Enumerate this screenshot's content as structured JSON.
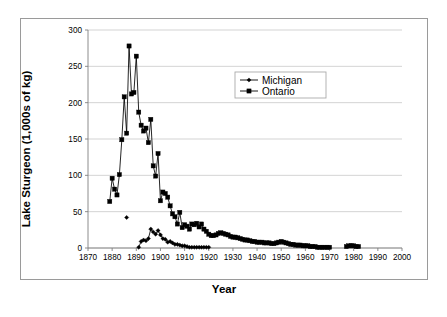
{
  "chart_data": {
    "type": "line",
    "title": "",
    "xlabel": "Year",
    "ylabel": "Lake Sturgeon (1,000s of kg)",
    "xlim": [
      1870,
      2000
    ],
    "ylim": [
      0,
      300
    ],
    "xticks": [
      1870,
      1880,
      1890,
      1900,
      1910,
      1920,
      1930,
      1940,
      1950,
      1960,
      1970,
      1980,
      1990,
      2000
    ],
    "yticks": [
      0,
      50,
      100,
      150,
      200,
      250,
      300
    ],
    "xtick_labels": [
      "1870",
      "1880",
      "1890",
      "1900",
      "1910",
      "1920",
      "1930",
      "1940",
      "1950",
      "1960",
      "1970",
      "1980",
      "1990",
      "2000"
    ],
    "ytick_labels": [
      "0",
      "50",
      "100",
      "150",
      "200",
      "250",
      "300"
    ],
    "grid": "horizontal",
    "legend_position": "upper-center-right",
    "series": [
      {
        "name": "Michigan",
        "marker": "diamond",
        "color": "#000000",
        "x": [
          1886,
          1891,
          1892,
          1893,
          1894,
          1895,
          1896,
          1897,
          1898,
          1899,
          1900,
          1901,
          1902,
          1903,
          1904,
          1905,
          1906,
          1907,
          1908,
          1909,
          1910,
          1911,
          1912,
          1913,
          1914,
          1915,
          1916,
          1917,
          1918,
          1919,
          1920
        ],
        "y": [
          42,
          1,
          9,
          11,
          10,
          13,
          26,
          22,
          19,
          24,
          18,
          13,
          12,
          8,
          9,
          7,
          5,
          5,
          4,
          3,
          3,
          2,
          1,
          1,
          1,
          1,
          1,
          1,
          1,
          1,
          1
        ]
      },
      {
        "name": "Ontario",
        "marker": "square",
        "color": "#000000",
        "x": [
          1879,
          1880,
          1881,
          1882,
          1883,
          1884,
          1885,
          1886,
          1887,
          1888,
          1889,
          1890,
          1891,
          1892,
          1893,
          1894,
          1895,
          1896,
          1897,
          1898,
          1899,
          1900,
          1901,
          1902,
          1903,
          1904,
          1905,
          1906,
          1907,
          1908,
          1909,
          1910,
          1911,
          1912,
          1913,
          1914,
          1915,
          1916,
          1917,
          1918,
          1919,
          1920,
          1921,
          1922,
          1923,
          1924,
          1925,
          1926,
          1927,
          1928,
          1929,
          1930,
          1931,
          1932,
          1933,
          1934,
          1935,
          1936,
          1937,
          1938,
          1939,
          1940,
          1941,
          1942,
          1943,
          1944,
          1945,
          1946,
          1947,
          1948,
          1949,
          1950,
          1951,
          1952,
          1953,
          1954,
          1955,
          1956,
          1957,
          1958,
          1959,
          1960,
          1961,
          1962,
          1963,
          1964,
          1965,
          1966,
          1967,
          1968,
          1969,
          1970,
          1977,
          1978,
          1979,
          1980,
          1981,
          1982
        ],
        "y": [
          64,
          96,
          81,
          73,
          101,
          149,
          208,
          158,
          278,
          212,
          214,
          264,
          187,
          169,
          161,
          165,
          145,
          177,
          113,
          99,
          130,
          65,
          77,
          75,
          70,
          58,
          47,
          43,
          33,
          49,
          28,
          32,
          30,
          26,
          33,
          32,
          34,
          29,
          33,
          26,
          23,
          19,
          17,
          17,
          18,
          20,
          21,
          20,
          19,
          18,
          16,
          15,
          15,
          14,
          13,
          12,
          11,
          11,
          10,
          9,
          9,
          8,
          8,
          8,
          7,
          7,
          7,
          6,
          6,
          7,
          8,
          9,
          8,
          7,
          6,
          5,
          5,
          4,
          4,
          4,
          3,
          3,
          3,
          2,
          2,
          2,
          1,
          1,
          1,
          1,
          1,
          1,
          2,
          3,
          3,
          3,
          2,
          2
        ]
      }
    ],
    "legend": [
      {
        "label": "Michigan",
        "marker": "diamond"
      },
      {
        "label": "Ontario",
        "marker": "square"
      }
    ]
  },
  "figure": {
    "y_axis_title": "Lake Sturgeon (1,000s of kg)",
    "x_axis_title": "Year"
  }
}
